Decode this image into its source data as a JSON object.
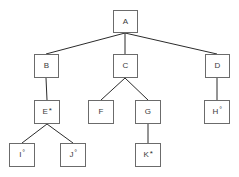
{
  "diagram": {
    "type": "tree",
    "background_color": "#ffffff",
    "node_border_color": "#6b6b6b",
    "node_fill_color": "#ffffff",
    "edge_color": "#2b2b2b",
    "text_color": "#3a3a3a",
    "nodes": [
      {
        "id": "A",
        "label": "A",
        "marker": "",
        "x": 113,
        "y": 10,
        "w": 25,
        "h": 23
      },
      {
        "id": "B",
        "label": "B",
        "marker": "",
        "x": 34,
        "y": 54,
        "w": 25,
        "h": 24
      },
      {
        "id": "C",
        "label": "C",
        "marker": "",
        "x": 113,
        "y": 54,
        "w": 25,
        "h": 24
      },
      {
        "id": "D",
        "label": "D",
        "marker": "",
        "x": 205,
        "y": 54,
        "w": 25,
        "h": 24
      },
      {
        "id": "E",
        "label": "E",
        "marker": "*",
        "x": 34,
        "y": 100,
        "w": 26,
        "h": 24
      },
      {
        "id": "F",
        "label": "F",
        "marker": "",
        "x": 88,
        "y": 100,
        "w": 26,
        "h": 24
      },
      {
        "id": "G",
        "label": "G",
        "marker": "",
        "x": 135,
        "y": 100,
        "w": 26,
        "h": 24
      },
      {
        "id": "H",
        "label": "H",
        "marker": "°",
        "x": 204,
        "y": 100,
        "w": 26,
        "h": 24
      },
      {
        "id": "I",
        "label": "I",
        "marker": "°",
        "x": 9,
        "y": 143,
        "w": 26,
        "h": 24
      },
      {
        "id": "J",
        "label": "J",
        "marker": "°",
        "x": 60,
        "y": 143,
        "w": 26,
        "h": 24
      },
      {
        "id": "K",
        "label": "K",
        "marker": "*",
        "x": 135,
        "y": 143,
        "w": 26,
        "h": 24
      }
    ],
    "edges": [
      {
        "from": "A",
        "to": "B",
        "x1": 125,
        "y1": 33,
        "x2": 46,
        "y2": 54
      },
      {
        "from": "A",
        "to": "C",
        "x1": 125,
        "y1": 33,
        "x2": 125,
        "y2": 54
      },
      {
        "from": "A",
        "to": "D",
        "x1": 125,
        "y1": 33,
        "x2": 217,
        "y2": 54
      },
      {
        "from": "B",
        "to": "E",
        "x1": 46,
        "y1": 78,
        "x2": 47,
        "y2": 100
      },
      {
        "from": "C",
        "to": "F",
        "x1": 125,
        "y1": 78,
        "x2": 101,
        "y2": 100
      },
      {
        "from": "C",
        "to": "G",
        "x1": 125,
        "y1": 78,
        "x2": 148,
        "y2": 100
      },
      {
        "from": "D",
        "to": "H",
        "x1": 217,
        "y1": 78,
        "x2": 217,
        "y2": 100
      },
      {
        "from": "E",
        "to": "I",
        "x1": 47,
        "y1": 124,
        "x2": 22,
        "y2": 143
      },
      {
        "from": "E",
        "to": "J",
        "x1": 47,
        "y1": 124,
        "x2": 73,
        "y2": 143
      },
      {
        "from": "G",
        "to": "K",
        "x1": 148,
        "y1": 124,
        "x2": 148,
        "y2": 143
      }
    ]
  }
}
